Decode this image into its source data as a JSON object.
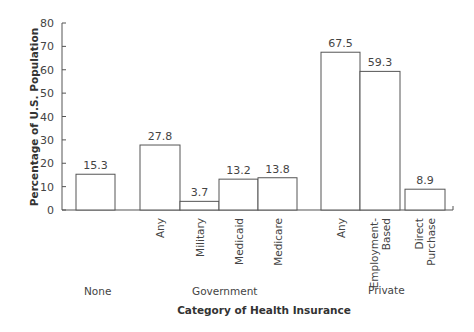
{
  "chart_data": {
    "type": "bar",
    "title": "",
    "xlabel": "Category of Health Insurance",
    "ylabel": "Percentage of U.S. Population",
    "ylim": [
      0,
      80
    ],
    "yticks": [
      0,
      10,
      20,
      30,
      40,
      50,
      60,
      70,
      80
    ],
    "grid": false,
    "legend": null,
    "groups": [
      {
        "name": "None",
        "categories": [
          ""
        ]
      },
      {
        "name": "Government",
        "categories": [
          "Any",
          "Military",
          "Medicaid",
          "Medicare"
        ]
      },
      {
        "name": "Private",
        "categories": [
          "Any",
          "Employment-Based",
          "Direct Purchase"
        ]
      }
    ],
    "categories": [
      "None",
      "Government: Any",
      "Government: Military",
      "Government: Medicaid",
      "Government: Medicare",
      "Private: Any",
      "Private: Employment-Based",
      "Private: Direct Purchase"
    ],
    "values": [
      15.3,
      27.8,
      3.7,
      13.2,
      13.8,
      67.5,
      59.3,
      8.9
    ],
    "bar_labels": [
      "",
      "Any",
      "Military",
      "Medicaid",
      "Medicare",
      "Any",
      "Employment-\nBased",
      "Direct\nPurchase"
    ],
    "value_labels": [
      "15.3",
      "27.8",
      "3.7",
      "13.2",
      "13.8",
      "67.5",
      "59.3",
      "8.9"
    ]
  },
  "labels": {
    "ylabel": "Percentage of U.S. Population",
    "xlabel": "Category of Health Insurance",
    "group_none": "None",
    "group_government": "Government",
    "group_private": "Private"
  }
}
